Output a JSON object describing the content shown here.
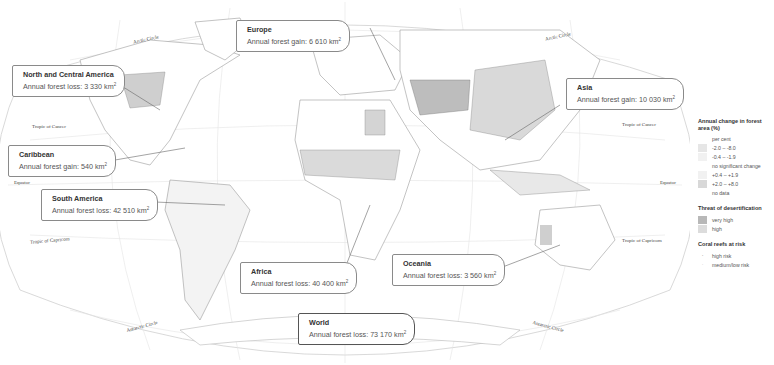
{
  "map": {
    "parallels": {
      "arctic_left": "Arctic Circle",
      "arctic_right": "Arctic Circle",
      "cancer_left": "Tropic of Cancer",
      "cancer_right": "Tropic of Cancer",
      "equator_left": "Equator",
      "equator_right": "Equator",
      "capricorn_left": "Tropic of Capricorn",
      "capricorn_right": "Tropic of Capricorn",
      "antarctic_left": "Antarctic Circle",
      "antarctic_right": "Antarctic Circle"
    },
    "callouts": [
      {
        "region": "Europe",
        "label": "Annual forest gain: 6 610 km",
        "sup": "2"
      },
      {
        "region": "North and Central America",
        "label": "Annual forest loss: 3 330 km",
        "sup": "2"
      },
      {
        "region": "Asia",
        "label": "Annual forest gain: 10 030 km",
        "sup": "2"
      },
      {
        "region": "Caribbean",
        "label": "Annual forest gain: 540 km",
        "sup": "2"
      },
      {
        "region": "South America",
        "label": "Annual forest loss: 42 510 km",
        "sup": "2"
      },
      {
        "region": "Africa",
        "label": "Annual forest loss: 40 400 km",
        "sup": "2"
      },
      {
        "region": "Oceania",
        "label": "Annual forest loss: 3 560 km",
        "sup": "2"
      },
      {
        "region": "World",
        "label": "Annual forest loss: 73 170 km",
        "sup": "2"
      }
    ]
  },
  "legend": {
    "forest_title": "Annual change in forest area (%)",
    "per_cent": "per cent",
    "forest_items": [
      {
        "label": "-2.0 – -8.0",
        "color": "#e6e6e6"
      },
      {
        "label": "-0.4 – -1.9",
        "color": "#f1f1f1"
      },
      {
        "label": "no significant change",
        "color": "#ffffff"
      },
      {
        "label": "+0.4 – +1.9",
        "color": "#f1f1f1"
      },
      {
        "label": "+2.0 – +8.0",
        "color": "#d8d8d8"
      },
      {
        "label": "no data",
        "color": "#ffffff"
      }
    ],
    "desert_title": "Threat of desertification",
    "desert_items": [
      {
        "label": "very high",
        "color": "#b8b8b8"
      },
      {
        "label": "high",
        "color": "#dcdcdc"
      }
    ],
    "coral_title": "Coral reefs at risk",
    "coral_items": [
      {
        "label": "high risk",
        "symbol": "dot-dark"
      },
      {
        "label": "medium/low risk",
        "symbol": "dot-light"
      }
    ]
  }
}
